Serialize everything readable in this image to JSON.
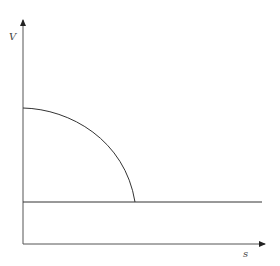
{
  "diagram": {
    "axes": {
      "y_label": "V",
      "x_label": "s"
    },
    "elements": [
      {
        "type": "quarter-curve",
        "description": "concave-down curve from the V-axis descending to the horizontal line"
      },
      {
        "type": "horizontal-line",
        "description": "constant level line across the plot"
      }
    ],
    "colors": {
      "line": "#333333",
      "background": "#ffffff"
    }
  }
}
